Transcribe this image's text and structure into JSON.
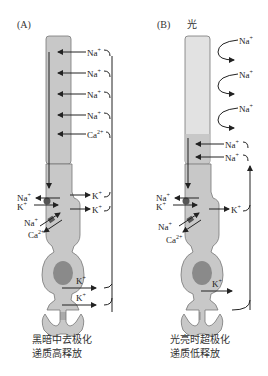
{
  "panels": [
    {
      "id": "A",
      "label": "(A)",
      "condition": "",
      "outer_segment_ions": [
        "Na+",
        "Na+",
        "Na+",
        "Na+",
        "Ca2+"
      ],
      "inner_segment_ions_out": [
        "K+",
        "K+"
      ],
      "exchanger_ions": {
        "pump": [
          "Na+",
          "K+"
        ],
        "exchanger": [
          "Na+",
          "Ca2+"
        ]
      },
      "terminal_ions": [
        "K+",
        "K+"
      ],
      "caption": [
        "黑暗中去极化",
        "递质高释放"
      ]
    },
    {
      "id": "B",
      "label": "(B)",
      "condition": "光",
      "outer_segment_ions": [
        "Na+",
        "Na+",
        "Na+"
      ],
      "outer_segment_lower_ions": [
        "Na+",
        "Na+"
      ],
      "inner_segment_ions_out": [
        "K+"
      ],
      "exchanger_ions": {
        "pump": [
          "Na+",
          "K+"
        ],
        "exchanger": [
          "Na+",
          "Ca2+"
        ]
      },
      "terminal_ions": [
        "K+"
      ],
      "caption": [
        "光亮时超极化",
        "递质低释放"
      ]
    }
  ],
  "text": {
    "A_label": "(A)",
    "B_label": "(B)",
    "B_light": "光",
    "Na": "Na",
    "K": "K",
    "Ca": "Ca",
    "plus": "+",
    "twoplus": "2+",
    "A_caption_1": "黑暗中去极化",
    "A_caption_2": "递质高释放",
    "B_caption_1": "光亮时超极化",
    "B_caption_2": "递质低释放"
  },
  "colors": {
    "cell_fill": "#c8c8c8",
    "nucleus_fill": "#8a8a8a",
    "line": "#222222"
  }
}
